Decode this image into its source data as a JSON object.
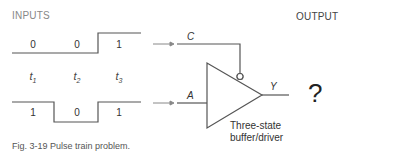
{
  "headers": {
    "inputs": "INPUTS",
    "output": "OUTPUT"
  },
  "waveform_c": {
    "bits": [
      "0",
      "0",
      "1"
    ]
  },
  "waveform_a": {
    "bits": [
      "1",
      "0",
      "1"
    ]
  },
  "time_labels": [
    {
      "base": "t",
      "sub": "1"
    },
    {
      "base": "t",
      "sub": "2"
    },
    {
      "base": "t",
      "sub": "3"
    }
  ],
  "signals": {
    "control": "C",
    "input": "A",
    "output": "Y"
  },
  "gate": {
    "line1": "Three-state",
    "line2": "buffer/driver"
  },
  "output_value": "?",
  "caption": "Fig. 3-19  Pulse train problem.",
  "colors": {
    "line": "#555555",
    "text": "#333333"
  }
}
